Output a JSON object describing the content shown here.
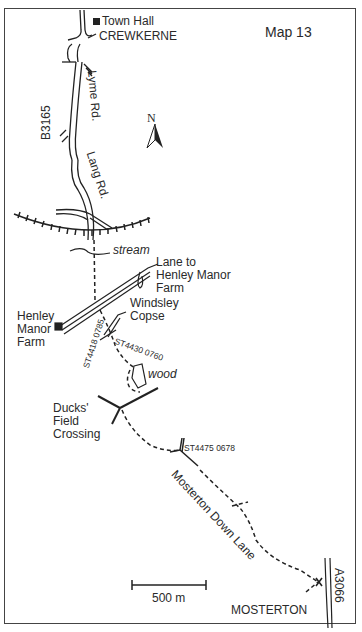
{
  "map": {
    "title": "Map 13",
    "north_label": "N",
    "scale_label": "500 m",
    "places": {
      "town_hall": "Town Hall",
      "crewkerne": "CREWKERNE",
      "mosterton": "MOSTERTON",
      "henley_manor_farm": [
        "Henley",
        "Manor",
        "Farm"
      ],
      "windsley_copse": [
        "Windsley",
        "Copse"
      ],
      "ducks_field_crossing": [
        "Ducks'",
        "Field",
        "Crossing"
      ],
      "lane_to_henley": [
        "Lane to",
        "Henley Manor",
        "Farm"
      ]
    },
    "roads": {
      "b3165": "B3165",
      "lyme_rd": "Lyme Rd.",
      "lang_rd": "Lang Rd.",
      "mosterton_down_lane": "Mosterton Down Lane",
      "a3066": "A3066"
    },
    "features": {
      "stream": "stream",
      "wood": "wood"
    },
    "grid_refs": {
      "ref1": "ST4418 0785",
      "ref2": "ST4430 0760",
      "ref3": "ST4475 0678"
    }
  }
}
